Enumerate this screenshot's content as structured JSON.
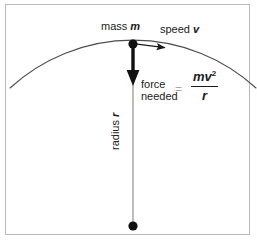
{
  "figure": {
    "background_color": "#ffffff",
    "frame_color": "#b9b9b9",
    "ink_color": "#1b1b1b",
    "arc_color": "#4d4d4d",
    "radius_line_color": "#9a9a9a",
    "equals_color": "#a9a9a9"
  },
  "labels": {
    "mass": {
      "text": "mass",
      "symbol": "m"
    },
    "speed": {
      "text": "speed",
      "symbol": "v"
    },
    "force": {
      "line1": "force",
      "line2": "needed"
    },
    "equals": "=",
    "radius": {
      "text": "radius",
      "symbol": "r"
    }
  },
  "formula": {
    "numerator_m": "m",
    "numerator_v": "v",
    "numerator_exponent": "2",
    "denominator": "r"
  },
  "geometry": {
    "mass_point": {
      "x": 133,
      "y": 44
    },
    "center_point": {
      "x": 133,
      "y": 226
    },
    "force_arrow": {
      "from_y": 47,
      "to_y": 84
    },
    "velocity_arrow": {
      "from_x": 136,
      "to_x": 166,
      "y": 44
    },
    "arc_radius": 182
  }
}
